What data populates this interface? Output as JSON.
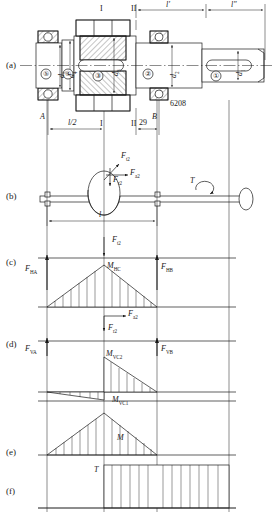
{
  "figure": {
    "panels": [
      {
        "id": "a",
        "label": "(a)",
        "desc": "shaft assembly structural drawing"
      },
      {
        "id": "b",
        "label": "(b)",
        "desc": "simply supported shaft force model"
      },
      {
        "id": "c",
        "label": "(c)",
        "desc": "horizontal plane bending moment diagram"
      },
      {
        "id": "d",
        "label": "(d)",
        "desc": "vertical plane bending moment diagram"
      },
      {
        "id": "e",
        "label": "(e)",
        "desc": "resultant bending moment diagram"
      },
      {
        "id": "f",
        "label": "(f)",
        "desc": "torque diagram"
      }
    ]
  },
  "panel_a": {
    "section_marks": [
      "I",
      "II",
      "I",
      "II"
    ],
    "dimensions": [
      "l'",
      "l\"",
      "l/2",
      "29"
    ],
    "supports": [
      "A",
      "B"
    ],
    "bearing_code": "6208",
    "diameters": [
      {
        "tag": "1",
        "label_d": "d",
        "label_sub": "1"
      },
      {
        "tag": "2",
        "label_d": "d",
        "label_sub": "2"
      },
      {
        "tag": "3",
        "label_d": "d",
        "label_sub": "3"
      },
      {
        "tag": "4",
        "label_d": "d",
        "label_sub": "4"
      },
      {
        "tag": "5",
        "label_d": "d",
        "label_sub": "5"
      }
    ],
    "step_numbers": [
      "①",
      "②",
      "③",
      "④",
      "⑤"
    ]
  },
  "panel_b": {
    "forces": [
      {
        "name": "Ft2",
        "base": "F",
        "sub": "t2"
      },
      {
        "name": "Fa2",
        "base": "F",
        "sub": "a2"
      },
      {
        "name": "Fr2",
        "base": "F",
        "sub": "r2"
      }
    ],
    "span_label": "l",
    "torque_label": "T"
  },
  "panel_c": {
    "applied_force": {
      "base": "F",
      "sub": "t2"
    },
    "reactions": [
      {
        "base": "F",
        "sub": "HA"
      },
      {
        "base": "F",
        "sub": "HB"
      }
    ],
    "moment": {
      "base": "M",
      "sub": "HC"
    },
    "shape": "triangle-peak-at-C"
  },
  "panel_d": {
    "applied_forces": [
      {
        "base": "F",
        "sub": "a2"
      },
      {
        "base": "F",
        "sub": "r2"
      }
    ],
    "reactions": [
      {
        "base": "F",
        "sub": "VA"
      },
      {
        "base": "F",
        "sub": "VB"
      }
    ],
    "moments": [
      {
        "base": "M",
        "sub": "VC2"
      },
      {
        "base": "M",
        "sub": "VC1"
      }
    ],
    "shape": "step-jump-at-C"
  },
  "panel_e": {
    "moment": {
      "base": "M",
      "sub": ""
    },
    "shape": "combined-triangle"
  },
  "panel_f": {
    "torque": {
      "base": "T",
      "sub": ""
    },
    "shape": "rectangle-from-C-to-right"
  },
  "colors": {
    "ink": "#1a1a1a",
    "line": "#222222",
    "hatch": "#3a3a3a",
    "background": "#ffffff"
  }
}
